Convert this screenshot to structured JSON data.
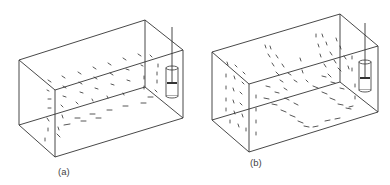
{
  "figure": {
    "panels": [
      {
        "id": "a",
        "label": "(a)",
        "label_pos": [
          58,
          175
        ],
        "box": {
          "A": [
            19,
            60
          ],
          "B": [
            55,
            90
          ],
          "C": [
            183,
            50
          ],
          "D": [
            145,
            20
          ],
          "A2": [
            19,
            125
          ],
          "B2": [
            55,
            157
          ],
          "C2": [
            183,
            118
          ],
          "D2": [
            145,
            87
          ]
        },
        "probe": {
          "x": 166,
          "y": 66,
          "w": 12,
          "h": 32,
          "rod_top": 27,
          "band_y": 83
        },
        "field_description": "single recirculating vortex; flow along bottom toward left, rising on far wall",
        "vectors": [
          [
            48,
            80,
            3,
            2
          ],
          [
            62,
            76,
            3,
            2
          ],
          [
            78,
            72,
            3,
            2
          ],
          [
            93,
            67,
            3,
            2
          ],
          [
            108,
            63,
            3,
            2
          ],
          [
            123,
            58,
            3,
            2
          ],
          [
            138,
            54,
            3,
            2
          ],
          [
            47,
            90,
            2,
            1
          ],
          [
            63,
            86,
            3,
            2
          ],
          [
            79,
            82,
            3,
            2
          ],
          [
            94,
            77,
            3,
            2
          ],
          [
            110,
            73,
            3,
            2
          ],
          [
            126,
            69,
            3,
            1
          ],
          [
            141,
            65,
            2,
            1
          ],
          [
            48,
            99,
            3,
            0
          ],
          [
            63,
            96,
            3,
            1
          ],
          [
            80,
            92,
            3,
            1
          ],
          [
            95,
            88,
            3,
            1
          ],
          [
            111,
            84,
            3,
            1
          ],
          [
            127,
            80,
            3,
            1
          ],
          [
            144,
            76,
            0,
            3
          ],
          [
            48,
            108,
            3,
            0
          ],
          [
            61,
            105,
            2,
            2
          ],
          [
            76,
            102,
            2,
            2
          ],
          [
            92,
            99,
            1,
            2
          ],
          [
            107,
            96,
            1,
            2
          ],
          [
            123,
            93,
            1,
            2
          ],
          [
            144,
            86,
            0,
            3
          ],
          [
            47,
            118,
            2,
            3
          ],
          [
            62,
            115,
            1,
            3
          ],
          [
            80,
            118,
            -5,
            0
          ],
          [
            95,
            114,
            -5,
            0
          ],
          [
            112,
            110,
            -5,
            0
          ],
          [
            128,
            106,
            -5,
            0
          ],
          [
            146,
            103,
            -5,
            0
          ],
          [
            48,
            128,
            0,
            3
          ],
          [
            58,
            127,
            1,
            3
          ],
          [
            70,
            124,
            -6,
            1
          ],
          [
            86,
            121,
            -5,
            0
          ],
          [
            101,
            118,
            -5,
            0
          ],
          [
            45,
            138,
            0,
            3
          ],
          [
            57,
            134,
            3,
            3
          ],
          [
            153,
            97,
            -5,
            0
          ],
          [
            155,
            90,
            2,
            2
          ],
          [
            157,
            72,
            0,
            3
          ],
          [
            157,
            80,
            0,
            3
          ],
          [
            158,
            64,
            0,
            3
          ],
          [
            150,
            55,
            2,
            2
          ]
        ]
      },
      {
        "id": "b",
        "label": "(b)",
        "label_pos": [
          250,
          166
        ],
        "box": {
          "A": [
            212,
            52
          ],
          "B": [
            249,
            84
          ],
          "C": [
            378,
            46
          ],
          "D": [
            340,
            14
          ],
          "A2": [
            212,
            120
          ],
          "B2": [
            249,
            152
          ],
          "C2": [
            378,
            112
          ],
          "D2": [
            340,
            82
          ]
        },
        "probe": {
          "x": 359,
          "y": 60,
          "w": 12,
          "h": 32,
          "rod_top": 23,
          "band_y": 78
        },
        "field_description": "multiple counter-rotating cells; steep diagonal streaks",
        "vectors": [
          [
            227,
            62,
            1,
            3
          ],
          [
            235,
            65,
            2,
            2
          ],
          [
            243,
            72,
            2,
            2
          ],
          [
            226,
            74,
            0,
            3
          ],
          [
            234,
            76,
            1,
            3
          ],
          [
            242,
            82,
            2,
            2
          ],
          [
            226,
            86,
            0,
            3
          ],
          [
            233,
            88,
            1,
            3
          ],
          [
            240,
            92,
            2,
            2
          ],
          [
            226,
            98,
            0,
            3
          ],
          [
            233,
            100,
            1,
            3
          ],
          [
            240,
            103,
            2,
            2
          ],
          [
            226,
            108,
            0,
            3
          ],
          [
            234,
            111,
            1,
            3
          ],
          [
            242,
            114,
            1,
            3
          ],
          [
            230,
            120,
            0,
            3
          ],
          [
            238,
            124,
            1,
            3
          ],
          [
            246,
            128,
            0,
            3
          ],
          [
            256,
            95,
            0,
            3
          ],
          [
            256,
            108,
            0,
            3
          ],
          [
            256,
            120,
            0,
            3
          ],
          [
            256,
            132,
            0,
            3
          ],
          [
            265,
            45,
            1,
            3
          ],
          [
            268,
            54,
            2,
            3
          ],
          [
            272,
            63,
            2,
            3
          ],
          [
            276,
            72,
            3,
            3
          ],
          [
            280,
            80,
            3,
            2
          ],
          [
            284,
            88,
            3,
            2
          ],
          [
            270,
            46,
            1,
            3
          ],
          [
            276,
            55,
            2,
            3
          ],
          [
            282,
            64,
            2,
            3
          ],
          [
            288,
            73,
            3,
            2
          ],
          [
            294,
            80,
            3,
            2
          ],
          [
            264,
            98,
            5,
            1
          ],
          [
            272,
            104,
            5,
            1
          ],
          [
            281,
            110,
            5,
            2
          ],
          [
            290,
            115,
            5,
            2
          ],
          [
            298,
            121,
            5,
            2
          ],
          [
            304,
            126,
            5,
            1
          ],
          [
            266,
            86,
            4,
            1
          ],
          [
            275,
            92,
            4,
            1
          ],
          [
            285,
            98,
            4,
            2
          ],
          [
            294,
            103,
            4,
            2
          ],
          [
            316,
            34,
            0,
            3
          ],
          [
            318,
            44,
            1,
            3
          ],
          [
            320,
            54,
            1,
            3
          ],
          [
            324,
            64,
            2,
            3
          ],
          [
            328,
            74,
            3,
            3
          ],
          [
            322,
            34,
            1,
            3
          ],
          [
            326,
            42,
            1,
            3
          ],
          [
            330,
            52,
            2,
            3
          ],
          [
            334,
            60,
            2,
            3
          ],
          [
            338,
            68,
            3,
            3
          ],
          [
            336,
            38,
            1,
            3
          ],
          [
            340,
            46,
            1,
            3
          ],
          [
            344,
            56,
            2,
            3
          ],
          [
            348,
            66,
            1,
            3
          ],
          [
            352,
            56,
            0,
            3
          ],
          [
            352,
            68,
            0,
            3
          ],
          [
            313,
            86,
            5,
            2
          ],
          [
            322,
            92,
            5,
            2
          ],
          [
            330,
            98,
            5,
            2
          ],
          [
            338,
            104,
            5,
            1
          ],
          [
            346,
            108,
            5,
            1
          ],
          [
            322,
            76,
            4,
            1
          ],
          [
            331,
            82,
            4,
            1
          ],
          [
            340,
            88,
            4,
            1
          ],
          [
            355,
            84,
            0,
            3
          ],
          [
            355,
            96,
            0,
            3
          ],
          [
            353,
            106,
            -4,
            1
          ],
          [
            340,
            118,
            -5,
            1
          ],
          [
            330,
            120,
            -5,
            1
          ],
          [
            318,
            126,
            -5,
            1
          ],
          [
            300,
            58,
            1,
            3
          ],
          [
            302,
            70,
            1,
            3
          ],
          [
            306,
            80,
            2,
            2
          ]
        ]
      }
    ]
  }
}
